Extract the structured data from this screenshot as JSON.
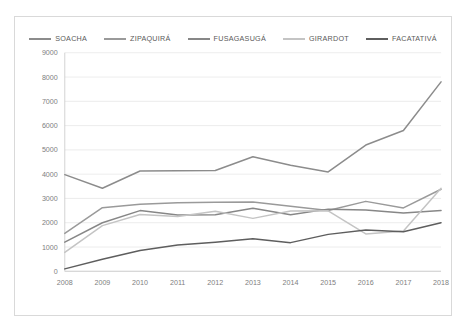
{
  "chart_data": {
    "type": "line",
    "title": "",
    "subtitle": "",
    "xlabel": "",
    "ylabel": "",
    "categories": [
      "2008",
      "2009",
      "2010",
      "2011",
      "2012",
      "2013",
      "2014",
      "2015",
      "2016",
      "2017",
      "2018"
    ],
    "x": [
      2008,
      2009,
      2010,
      2011,
      2012,
      2013,
      2014,
      2015,
      2016,
      2017,
      2018
    ],
    "ylim": [
      0,
      9000
    ],
    "ytick_labels": [
      "0",
      "1000",
      "2000",
      "3000",
      "4000",
      "5000",
      "6000",
      "7000",
      "8000",
      "9000"
    ],
    "ytick_values": [
      0,
      1000,
      2000,
      3000,
      4000,
      5000,
      6000,
      7000,
      8000,
      9000
    ],
    "grid": true,
    "legend_position": "top",
    "series": [
      {
        "name": "SOACHA",
        "color": "#8c8c8c",
        "values": [
          3980,
          3420,
          4130,
          4140,
          4150,
          4720,
          4370,
          4090,
          5200,
          5800,
          7800
        ]
      },
      {
        "name": "ZIPAQUIRÁ",
        "color": "#9a9a9a",
        "values": [
          1560,
          2620,
          2760,
          2820,
          2840,
          2850,
          2680,
          2500,
          2880,
          2610,
          3380
        ]
      },
      {
        "name": "FUSAGASUGÁ",
        "color": "#878787",
        "values": [
          1200,
          2000,
          2500,
          2320,
          2330,
          2600,
          2330,
          2560,
          2520,
          2400,
          2500
        ]
      },
      {
        "name": "GIRARDOT",
        "color": "#c4c4c4",
        "values": [
          780,
          1880,
          2340,
          2260,
          2470,
          2180,
          2480,
          2490,
          1540,
          1660,
          3420
        ]
      },
      {
        "name": "FACATATIVÁ",
        "color": "#5e5e5e",
        "values": [
          100,
          500,
          860,
          1080,
          1200,
          1340,
          1180,
          1520,
          1700,
          1630,
          2000
        ]
      }
    ]
  }
}
